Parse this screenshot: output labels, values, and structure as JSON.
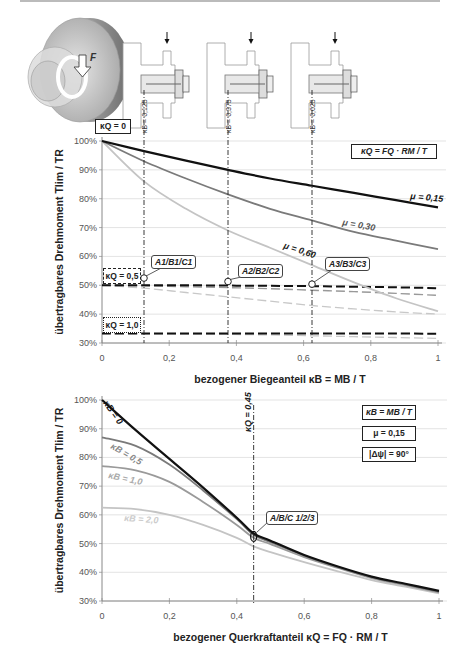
{
  "illustration": {
    "force_label": "F",
    "sketch_labels": [
      "κB = 0,125",
      "κB = 0,375",
      "κB = 0,625"
    ]
  },
  "chart_data": [
    {
      "type": "line",
      "title": "",
      "xlabel": "bezogener Biegeanteil  κB = MB / T",
      "ylabel": "übertragbares Drehmoment Tlim / TR",
      "xlim": [
        0,
        1
      ],
      "ylim": [
        30,
        100
      ],
      "x_ticks": [
        "0",
        "0,2",
        "0,4",
        "0,6",
        "0,8",
        "1"
      ],
      "y_ticks": [
        "30%",
        "40%",
        "50%",
        "60%",
        "70%",
        "80%",
        "90%",
        "100%"
      ],
      "grid": true,
      "annotations": {
        "corner_box": "κQ = 0",
        "formula_box": "κQ = FQ · RM / T",
        "kq05_box": "κQ = 0,5",
        "kq10_box": "κQ = 1,0",
        "points": [
          "A1/B1/C1",
          "A2/B2/C2",
          "A3/B3/C3"
        ],
        "vertical_lines_x": [
          0.125,
          0.375,
          0.625
        ]
      },
      "x": [
        0,
        0.125,
        0.25,
        0.375,
        0.5,
        0.625,
        0.75,
        0.875,
        1
      ],
      "series": [
        {
          "name": "μ = 0,15 (κQ = 0)",
          "style": "solid-black",
          "values": [
            100,
            96.5,
            93.2,
            90.0,
            87.0,
            84.5,
            82.0,
            79.5,
            77.0
          ]
        },
        {
          "name": "μ = 0,30 (κQ = 0)",
          "style": "solid-darkgray",
          "values": [
            100,
            93.0,
            87.0,
            81.5,
            76.5,
            72.5,
            68.5,
            65.5,
            62.5
          ]
        },
        {
          "name": "μ = 0,60 (κQ = 0)",
          "style": "solid-lightgray",
          "values": [
            100,
            86.0,
            76.5,
            69.0,
            63.0,
            57.0,
            51.0,
            45.5,
            41.0
          ]
        },
        {
          "name": "μ = 0,15 (κQ = 0,5)",
          "style": "dashed-black",
          "values": [
            50.0,
            50.0,
            50.0,
            49.9,
            49.8,
            49.7,
            49.5,
            49.3,
            49.0
          ]
        },
        {
          "name": "μ = 0,30 (κQ = 0,5)",
          "style": "dashed-darkgray",
          "values": [
            50.0,
            49.8,
            49.5,
            49.2,
            48.8,
            48.3,
            47.8,
            47.2,
            46.5
          ]
        },
        {
          "name": "μ = 0,60 (κQ = 0,5)",
          "style": "dashed-lightgray",
          "values": [
            50.0,
            49.0,
            47.5,
            46.0,
            44.5,
            43.0,
            41.8,
            40.8,
            40.0
          ]
        },
        {
          "name": "μ = 0,15 (κQ = 1,0)",
          "style": "dashed-black",
          "values": [
            33.3,
            33.3,
            33.3,
            33.3,
            33.3,
            33.3,
            33.3,
            33.3,
            33.2
          ]
        },
        {
          "name": "μ = 0,30 (κQ = 1,0)",
          "style": "dashed-lightgray",
          "values": [
            33.3,
            33.2,
            33.1,
            33.0,
            32.8,
            32.5,
            32.2,
            31.9,
            31.6
          ]
        }
      ],
      "curve_labels": [
        "μ = 0,15",
        "μ = 0,30",
        "μ = 0,60"
      ]
    },
    {
      "type": "line",
      "title": "",
      "xlabel": "bezogener Querkraftanteil  κQ = FQ · RM / T",
      "ylabel": "übertragbares Drehmoment Tlim / TR",
      "xlim": [
        0,
        1
      ],
      "ylim": [
        30,
        100
      ],
      "x_ticks": [
        "0",
        "0,2",
        "0,4",
        "0,6",
        "0,8",
        "1"
      ],
      "y_ticks": [
        "30%",
        "40%",
        "50%",
        "60%",
        "70%",
        "80%",
        "90%",
        "100%"
      ],
      "grid": true,
      "annotations": {
        "box1": "κB = MB / T",
        "box2": "μ = 0,15",
        "box3": "|Δψ| = 90°",
        "vertical_line_label": "κQ = 0,45",
        "vertical_line_x": 0.45,
        "point": "A/B/C 1/2/3"
      },
      "x": [
        0,
        0.1,
        0.2,
        0.3,
        0.4,
        0.45,
        0.5,
        0.6,
        0.7,
        0.8,
        0.9,
        1
      ],
      "series": [
        {
          "name": "κB = 0",
          "style": "solid-black",
          "values": [
            100,
            89.5,
            79.5,
            69.5,
            59.0,
            53.5,
            51.0,
            46.0,
            42.0,
            38.5,
            36.0,
            33.5
          ]
        },
        {
          "name": "κB = 0,5",
          "style": "solid-darkgray",
          "values": [
            87.0,
            84.0,
            77.5,
            68.5,
            58.5,
            53.0,
            50.5,
            45.8,
            41.8,
            38.3,
            35.8,
            33.3
          ]
        },
        {
          "name": "κB = 1,0",
          "style": "solid-gray",
          "values": [
            77.0,
            75.5,
            71.5,
            64.5,
            56.5,
            52.0,
            49.8,
            45.3,
            41.5,
            38.0,
            35.5,
            33.0
          ]
        },
        {
          "name": "κB = 2,0",
          "style": "solid-lightgray",
          "values": [
            62.5,
            62.0,
            60.0,
            56.5,
            52.0,
            49.0,
            47.0,
            43.5,
            40.3,
            37.3,
            35.0,
            32.7
          ]
        }
      ],
      "curve_labels": [
        "κB = 0",
        "κB = 0,5",
        "κB = 1,0",
        "κB = 2,0"
      ]
    }
  ]
}
